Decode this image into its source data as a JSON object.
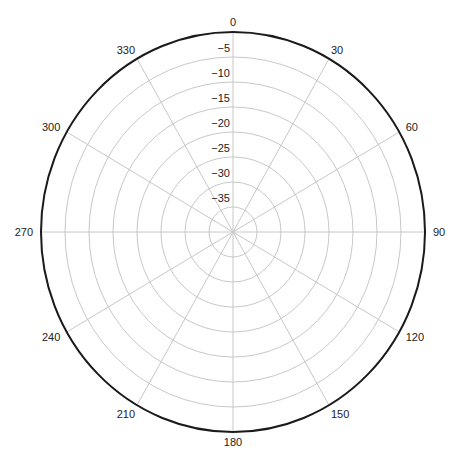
{
  "chart_data": {
    "type": "polar",
    "title": "",
    "theta_direction": "clockwise",
    "theta_zero": "top",
    "angular_ticks": [
      0,
      30,
      60,
      90,
      120,
      150,
      180,
      210,
      240,
      270,
      300,
      330
    ],
    "angular_tick_labels": [
      "0",
      "30",
      "60",
      "90",
      "120",
      "150",
      "180",
      "210",
      "240",
      "270",
      "300",
      "330"
    ],
    "radial_ticks": [
      0,
      -5,
      -10,
      -15,
      -20,
      -25,
      -30,
      -35
    ],
    "radial_tick_labels": [
      "0",
      "−5",
      "−10",
      "−15",
      "−20",
      "−25",
      "−30",
      "−35"
    ],
    "rlim": [
      -40,
      0
    ],
    "grid": true,
    "series": []
  }
}
